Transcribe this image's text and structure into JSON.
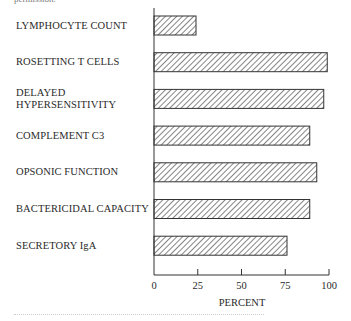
{
  "header": {
    "note": "permission."
  },
  "chart_data": {
    "type": "bar",
    "orientation": "horizontal",
    "title": "",
    "categories": [
      "LYMPHOCYTE COUNT",
      "ROSETTING T CELLS",
      "DELAYED HYPERSENSITIVITY",
      "COMPLEMENT C3",
      "OPSONIC FUNCTION",
      "BACTERICIDAL CAPACITY",
      "SECRETORY IgA"
    ],
    "label_lines": [
      [
        "LYMPHOCYTE COUNT"
      ],
      [
        "ROSETTING T CELLS"
      ],
      [
        "DELAYED",
        "HYPERSENSITIVITY"
      ],
      [
        "COMPLEMENT C3"
      ],
      [
        "OPSONIC FUNCTION"
      ],
      [
        "BACTERICIDAL CAPACITY"
      ],
      [
        "SECRETORY IgA"
      ]
    ],
    "values": [
      24,
      99,
      97,
      89,
      93,
      89,
      76
    ],
    "xlabel": "PERCENT",
    "ylabel": "",
    "xlim": [
      0,
      100
    ],
    "xticks": [
      "0",
      "25",
      "50",
      "75",
      "100"
    ],
    "grid": false,
    "legend": null,
    "bar_fill": "diagonal hatch",
    "bar_color": "#333333"
  }
}
